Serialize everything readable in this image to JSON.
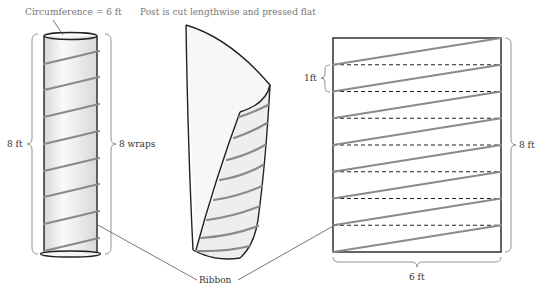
{
  "figure": {
    "labels": {
      "circumference": "Circumference = 6 ft",
      "caption": "Post is cut lengthwise and pressed flat",
      "height_left": "8 ft",
      "wraps": "8 wraps",
      "band_height": "1ft",
      "height_right": "8 ft",
      "width_bottom": "6 ft",
      "ribbon": "Ribbon"
    },
    "post": {
      "circumference_ft": 6,
      "height_ft": 8,
      "wraps": 8
    },
    "flattened": {
      "width_ft": 6,
      "height_ft": 8,
      "band_height_ft": 1,
      "bands": 8
    },
    "colors": {
      "outline": "#222222",
      "ribbon": "#8a8a8a",
      "fill": "#f0f0f0",
      "label_gray": "#777777"
    }
  }
}
